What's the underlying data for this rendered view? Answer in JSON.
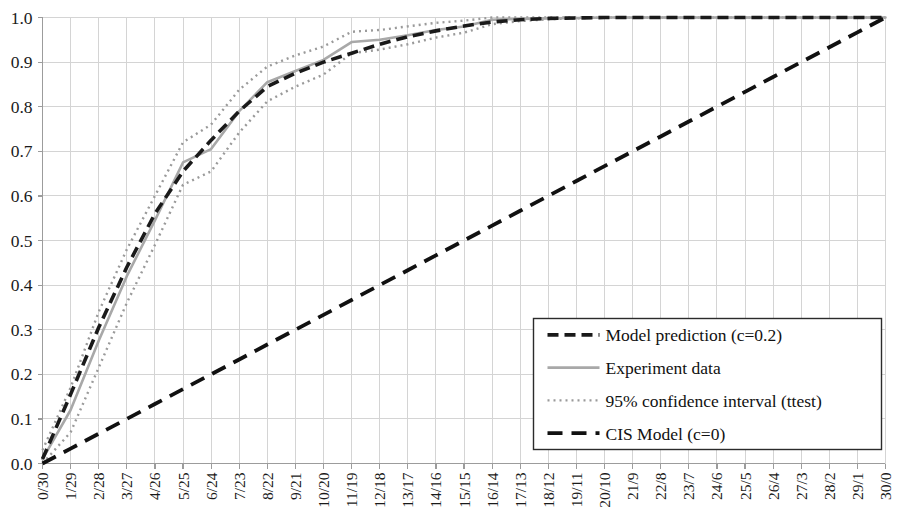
{
  "chart_data": {
    "type": "line",
    "title": "",
    "xlabel": "",
    "ylabel": "",
    "xlim": [
      0,
      30
    ],
    "ylim": [
      0.0,
      1.0
    ],
    "grid": true,
    "legend_position": "lower-right",
    "categories": [
      "0/30",
      "1/29",
      "2/28",
      "3/27",
      "4/26",
      "5/25",
      "6/24",
      "7/23",
      "8/22",
      "9/21",
      "10/20",
      "11/19",
      "12/18",
      "13/17",
      "14/16",
      "15/15",
      "16/14",
      "17/13",
      "18/12",
      "19/11",
      "20/10",
      "21/9",
      "22/8",
      "23/7",
      "24/6",
      "25/5",
      "26/4",
      "27/3",
      "28/2",
      "29/1",
      "30/0"
    ],
    "x": [
      0,
      1,
      2,
      3,
      4,
      5,
      6,
      7,
      8,
      9,
      10,
      11,
      12,
      13,
      14,
      15,
      16,
      17,
      18,
      19,
      20,
      21,
      22,
      23,
      24,
      25,
      26,
      27,
      28,
      29,
      30
    ],
    "ytick_labels": [
      "1.0",
      "0.9",
      "0.8",
      "0.7",
      "0.6",
      "0.5",
      "0.4",
      "0.3",
      "0.2",
      "0.1",
      "0.0"
    ],
    "ytick_values": [
      1.0,
      0.9,
      0.8,
      0.7,
      0.6,
      0.5,
      0.4,
      0.3,
      0.2,
      0.1,
      0.0
    ],
    "series": [
      {
        "name": "Model prediction (c=0.2)",
        "key": "model_prediction",
        "style": "dashed",
        "color": "#1a1a1a",
        "width": 3.6,
        "dash": "11,6",
        "values": [
          0.01,
          0.155,
          0.305,
          0.44,
          0.56,
          0.655,
          0.725,
          0.79,
          0.845,
          0.875,
          0.9,
          0.92,
          0.94,
          0.957,
          0.97,
          0.981,
          0.99,
          0.995,
          0.998,
          0.999,
          1.0,
          1.0,
          1.0,
          1.0,
          1.0,
          1.0,
          1.0,
          1.0,
          1.0,
          1.0,
          1.0
        ]
      },
      {
        "name": "Experiment data",
        "key": "experiment_data",
        "style": "solid",
        "color": "#a8a8a8",
        "width": 2.6,
        "dash": "",
        "values": [
          0.01,
          0.12,
          0.275,
          0.42,
          0.545,
          0.675,
          0.705,
          0.79,
          0.855,
          0.88,
          0.905,
          0.945,
          0.95,
          0.96,
          0.972,
          0.98,
          0.995,
          0.997,
          0.998,
          0.999,
          1.0,
          1.0,
          1.0,
          1.0,
          1.0,
          1.0,
          1.0,
          1.0,
          1.0,
          1.0,
          1.0
        ]
      },
      {
        "name": "95% confidence interval (ttest)",
        "key": "ci_upper",
        "style": "dotted",
        "color": "#9a9a9a",
        "width": 2.4,
        "dash": "2,4",
        "values": [
          0.03,
          0.17,
          0.34,
          0.48,
          0.6,
          0.72,
          0.76,
          0.838,
          0.89,
          0.915,
          0.935,
          0.968,
          0.972,
          0.98,
          0.988,
          0.993,
          1.0,
          1.0,
          1.0,
          1.0,
          1.0,
          1.0,
          1.0,
          1.0,
          1.0,
          1.0,
          1.0,
          1.0,
          1.0,
          1.0,
          1.0
        ]
      },
      {
        "name": "95% confidence interval (ttest)",
        "key": "ci_lower",
        "style": "dotted",
        "color": "#9a9a9a",
        "width": 2.4,
        "dash": "2,4",
        "values": [
          0.0,
          0.07,
          0.215,
          0.36,
          0.49,
          0.625,
          0.655,
          0.742,
          0.812,
          0.845,
          0.872,
          0.92,
          0.928,
          0.94,
          0.955,
          0.966,
          0.985,
          0.992,
          0.996,
          0.998,
          1.0,
          1.0,
          1.0,
          1.0,
          1.0,
          1.0,
          1.0,
          1.0,
          1.0,
          1.0,
          1.0
        ]
      },
      {
        "name": "CIS Model (c=0)",
        "key": "cis_model",
        "style": "dashed-long",
        "color": "#111111",
        "width": 3.8,
        "dash": "15,9",
        "values": [
          0.0,
          0.0333,
          0.0667,
          0.1,
          0.1333,
          0.1667,
          0.2,
          0.2333,
          0.2667,
          0.3,
          0.3333,
          0.3667,
          0.4,
          0.4333,
          0.4667,
          0.5,
          0.5333,
          0.5667,
          0.6,
          0.6333,
          0.6667,
          0.7,
          0.7333,
          0.7667,
          0.8,
          0.8333,
          0.8667,
          0.9,
          0.9333,
          0.9667,
          1.0
        ]
      }
    ],
    "legend_entries": [
      {
        "label": "Model prediction (c=0.2)",
        "style": "dashed",
        "color": "#1a1a1a",
        "width": 3.6,
        "dash": "11,6"
      },
      {
        "label": "Experiment data",
        "style": "solid",
        "color": "#a8a8a8",
        "width": 2.6,
        "dash": ""
      },
      {
        "label": "95% confidence interval (ttest)",
        "style": "dotted",
        "color": "#9a9a9a",
        "width": 2.4,
        "dash": "2,4"
      },
      {
        "label": "CIS Model (c=0)",
        "style": "dashed-long",
        "color": "#111111",
        "width": 3.8,
        "dash": "15,9"
      }
    ],
    "colors": {
      "grid": "#d4d4d4",
      "axis": "#9c9c9c",
      "background": "#ffffff",
      "legend_border": "#2b2b2b",
      "text": "#1a1a1a"
    }
  }
}
